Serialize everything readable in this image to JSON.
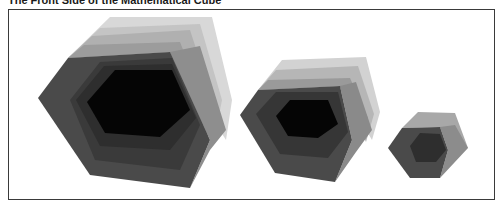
{
  "figure": {
    "title": "The Front Side of the Mathematical Cube",
    "cubes": [
      {
        "name": "large-cube",
        "label": ""
      },
      {
        "name": "medium-cube",
        "label": ""
      },
      {
        "name": "small-cube",
        "label": ""
      }
    ]
  },
  "colors": {
    "frame_border": "#3a3a3a",
    "background": "#ffffff",
    "face_light_1": "#d4d4d4",
    "face_light_2": "#b8b8b8",
    "face_mid_1": "#9a9a9a",
    "face_mid_2": "#7a7a7a",
    "front_outer": "#4a4a4a",
    "front_ring": "#333333",
    "front_core": "#050505"
  }
}
